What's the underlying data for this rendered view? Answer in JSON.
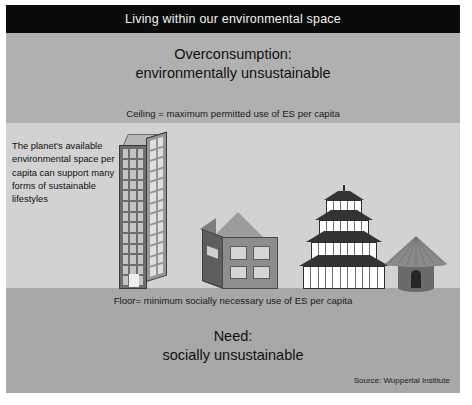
{
  "slide": {
    "title": "Living within our environmental space",
    "overconsumption_label": "Overconsumption:\nenvironmentally unsustainable",
    "overconsumption_line1": "Overconsumption:",
    "overconsumption_line2": "environmentally unsustainable",
    "ceiling_label": "Ceiling = maximum permitted use of ES per capita",
    "planet_text": "The planet's available environmental space per capita can support many forms of sustainable lifestyles",
    "floor_label": "Floor= minimum socially necessary use of ES per capita",
    "need_line1": "Need:",
    "need_line2": "socially unsustainable",
    "source": "Source: Wuppertal Institute"
  },
  "buildings": [
    {
      "name": "skyscraper",
      "icon": "skyscraper-icon",
      "floors": 13,
      "front_window_columns": 3,
      "side_window_columns": 2
    },
    {
      "name": "house",
      "icon": "house-icon",
      "front_windows": 4,
      "side_windows": 1
    },
    {
      "name": "pagoda",
      "icon": "pagoda-icon",
      "tiers": 4
    },
    {
      "name": "hut",
      "icon": "hut-icon",
      "doors": 1
    }
  ],
  "colors": {
    "title_bar": "#0b0b0b",
    "title_text": "#f2f2f2",
    "band_top": "#b0b0b0",
    "band_mid": "#d2d2d2",
    "band_bottom": "#a8a8a8",
    "text": "#111111"
  }
}
